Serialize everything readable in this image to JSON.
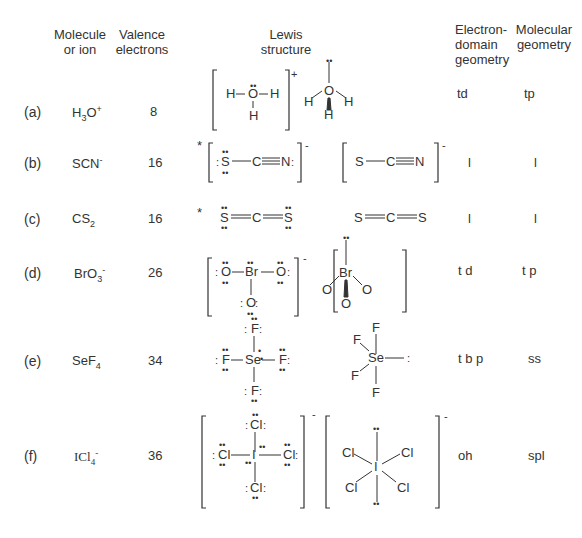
{
  "headers": {
    "molecule": "Molecule or ion",
    "valence": "Valence electrons",
    "lewis": "Lewis structure",
    "edg": "Electron-domain geometry",
    "mg": "Molecular geometry"
  },
  "rows": [
    {
      "label": "(a)",
      "formula": "H3O+",
      "formula_base": "H",
      "formula_sub": "3",
      "formula_rest": "O",
      "formula_sup": "+",
      "valence": "8",
      "edg": "td",
      "mg": "tp",
      "starred": false
    },
    {
      "label": "(b)",
      "formula": "SCN-",
      "formula_base": "SCN",
      "formula_sub": "",
      "formula_rest": "",
      "formula_sup": "-",
      "valence": "16",
      "edg": "l",
      "mg": "l",
      "starred": true
    },
    {
      "label": "(c)",
      "formula": "CS2",
      "formula_base": "CS",
      "formula_sub": "2",
      "formula_rest": "",
      "formula_sup": "",
      "valence": "16",
      "edg": "l",
      "mg": "l",
      "starred": true
    },
    {
      "label": "(d)",
      "formula": "BrO3-",
      "formula_base": "BrO",
      "formula_sub": "3",
      "formula_rest": "",
      "formula_sup": "-",
      "valence": "26",
      "edg": "t d",
      "mg": "t p",
      "starred": false
    },
    {
      "label": "(e)",
      "formula": "SeF4",
      "formula_base": "SeF",
      "formula_sub": "4",
      "formula_rest": "",
      "formula_sup": "",
      "valence": "34",
      "edg": "t b p",
      "mg": "ss",
      "starred": false
    },
    {
      "label": "(f)",
      "formula": "ICl4-",
      "formula_base": "ICl",
      "formula_sub": "4",
      "formula_rest": "",
      "formula_sup": "-",
      "valence": "36",
      "edg": "oh",
      "mg": "spl",
      "starred": false
    }
  ],
  "glyphs": {
    "star": "*",
    "plus": "+",
    "minus": "-",
    "H": "H",
    "O": "O",
    "S": "S",
    "C": "C",
    "N": "N",
    "Br": "Br",
    "F": "F",
    "Se": "Se",
    "Cl": "Cl",
    "I": "I"
  }
}
